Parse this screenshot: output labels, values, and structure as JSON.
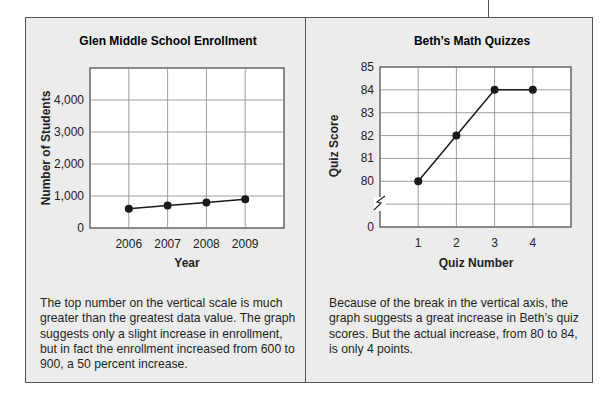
{
  "chart_data": [
    {
      "type": "line",
      "title": "Glen Middle School Enrollment",
      "xlabel": "Year",
      "ylabel": "Number of Students",
      "categories": [
        "2006",
        "2007",
        "2008",
        "2009"
      ],
      "values": [
        600,
        700,
        800,
        900
      ],
      "ylim": [
        0,
        5000
      ],
      "yticks": [
        0,
        1000,
        2000,
        3000,
        4000
      ],
      "ytick_labels": [
        "0",
        "1,000",
        "2,000",
        "3,000",
        "4,000"
      ],
      "grid": true,
      "caption": "The top number on the vertical scale is much greater than the greatest data value. The graph suggests only a slight increase in enrollment, but in fact the enrollment increased from 600 to 900, a 50 percent increase."
    },
    {
      "type": "line",
      "title": "Beth’s Math Quizzes",
      "xlabel": "Quiz Number",
      "ylabel": "Quiz Score",
      "categories": [
        "1",
        "2",
        "3",
        "4"
      ],
      "values": [
        80,
        82,
        84,
        84
      ],
      "ylim": [
        80,
        85
      ],
      "axis_break": true,
      "yticks": [
        0,
        80,
        81,
        82,
        83,
        84,
        85
      ],
      "ytick_labels": [
        "0",
        "80",
        "81",
        "82",
        "83",
        "84",
        "85"
      ],
      "grid": true,
      "caption": "Because of the break in the vertical axis, the graph suggests a great increase in Beth’s quiz scores. But the actual increase, from 80 to 84, is only 4 points."
    }
  ],
  "colors": {
    "panel_bg": "#ececec",
    "plot_bg": "#ffffff",
    "line": "#1a1a1a",
    "grid": "#888888"
  }
}
